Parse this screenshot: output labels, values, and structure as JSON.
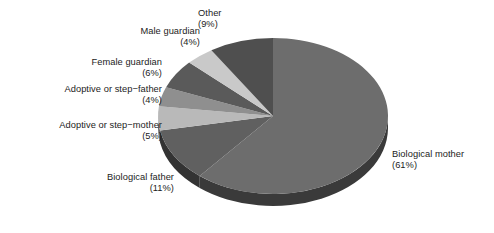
{
  "chart_data": {
    "type": "pie",
    "title": "",
    "subtitle": "",
    "xlabel": "",
    "ylabel": "",
    "legend_position": "none",
    "grid": false,
    "style": "3d-exploded-none-grayscale",
    "start_angle_deg": 0,
    "direction": "clockwise",
    "units": "percent",
    "categories": [
      "Biological mother",
      "Biological father",
      "Adoptive or step-mother",
      "Adoptive or step-father",
      "Female guardian",
      "Male guardian",
      "Other"
    ],
    "values": [
      61,
      11,
      5,
      4,
      6,
      4,
      9
    ],
    "colors": [
      "#6d6d6d",
      "#606060",
      "#b9b9b9",
      "#8f8f8f",
      "#5a5a5a",
      "#c9c9c9",
      "#4f4f4f"
    ],
    "side_colors": [
      "#3a3a3a",
      "#333333",
      "#6a6a6a",
      "#4e4e4e",
      "#303030",
      "#747474",
      "#2b2b2b"
    ],
    "slices": [
      {
        "name": "Biological mother",
        "value": 61,
        "label": "Biological mother",
        "percent_label": "(61%)",
        "color": "#6d6d6d"
      },
      {
        "name": "Biological father",
        "value": 11,
        "label": "Biological father",
        "percent_label": "(11%)",
        "color": "#606060"
      },
      {
        "name": "Adoptive or step-mother",
        "value": 5,
        "label": "Adoptive or step−mother",
        "percent_label": "(5%)",
        "color": "#b9b9b9"
      },
      {
        "name": "Adoptive or step-father",
        "value": 4,
        "label": "Adoptive or step−father",
        "percent_label": "(4%)",
        "color": "#8f8f8f"
      },
      {
        "name": "Female guardian",
        "value": 6,
        "label": "Female guardian",
        "percent_label": "(6%)",
        "color": "#5a5a5a"
      },
      {
        "name": "Male guardian",
        "value": 4,
        "label": "Male guardian",
        "percent_label": "(4%)",
        "color": "#c9c9c9"
      },
      {
        "name": "Other",
        "value": 9,
        "label": "Other",
        "percent_label": "(9%)",
        "color": "#4f4f4f"
      }
    ]
  },
  "geometry": {
    "center_x": 273,
    "center_y": 116,
    "radius_x": 115,
    "radius_y": 78,
    "depth": 12
  }
}
